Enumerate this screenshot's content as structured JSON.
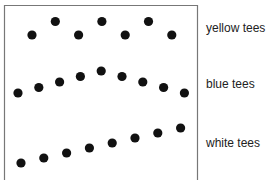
{
  "chart_data": {
    "type": "scatter",
    "title": "",
    "xlabel": "",
    "ylabel": "",
    "series": [
      {
        "name": "yellow tees",
        "label": "yellow tees",
        "points": [
          [
            1,
            0
          ],
          [
            2,
            1
          ],
          [
            3,
            0
          ],
          [
            4,
            1
          ],
          [
            5,
            0
          ],
          [
            6,
            1
          ],
          [
            7,
            0
          ]
        ]
      },
      {
        "name": "blue tees",
        "label": "blue tees",
        "points": [
          [
            1,
            0
          ],
          [
            2,
            1
          ],
          [
            3,
            2
          ],
          [
            4,
            3
          ],
          [
            5,
            4
          ],
          [
            6,
            3
          ],
          [
            7,
            2
          ],
          [
            8,
            1
          ],
          [
            9,
            0
          ]
        ]
      },
      {
        "name": "white tees",
        "label": "white tees",
        "points": [
          [
            1,
            0
          ],
          [
            2,
            1
          ],
          [
            3,
            2
          ],
          [
            4,
            3
          ],
          [
            5,
            4
          ],
          [
            6,
            5
          ],
          [
            7,
            6
          ],
          [
            8,
            7
          ]
        ]
      }
    ]
  },
  "labels": [
    "yellow tees",
    "blue tees",
    "white tees"
  ],
  "colors": {
    "dot": "#111111",
    "frame": "#777777"
  }
}
